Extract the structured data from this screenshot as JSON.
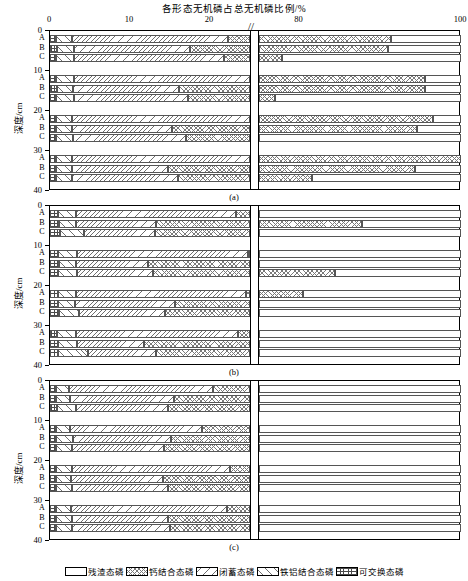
{
  "chart_data": {
    "type": "bar",
    "orientation": "horizontal",
    "stacked": true,
    "title": "各形态无机磷占总无机磷比例/%",
    "xlabel": "",
    "ylabel": "深度/cm",
    "xlim": [
      0,
      100
    ],
    "axis_break": {
      "low_end": 25,
      "high_start": 75,
      "marker": "//"
    },
    "xticks": [
      0,
      10,
      20,
      80,
      100
    ],
    "xticklabels": [
      "0",
      "10",
      "20",
      "80",
      "100"
    ],
    "yticks": [
      0,
      10,
      20,
      30,
      40
    ],
    "yticklabels": [
      "0",
      "10",
      "20",
      "30",
      "40"
    ],
    "grid": false,
    "legend_position": "bottom",
    "series": [
      {
        "name": "残渣态磷",
        "key": "residual",
        "pattern": "blank"
      },
      {
        "name": "钙结合态磷",
        "key": "ca_bound",
        "pattern": "cross-hatch"
      },
      {
        "name": "闭蓄态磷",
        "key": "occluded",
        "pattern": "backslash-hatch"
      },
      {
        "name": "铁铝结合态磷",
        "key": "fe_al_bound",
        "pattern": "forward-slash-hatch"
      },
      {
        "name": "可交换态磷",
        "key": "exchangeable",
        "pattern": "dense-grid"
      }
    ],
    "segment_order": [
      "exchangeable",
      "fe_al_bound",
      "occluded",
      "ca_bound",
      "residual"
    ],
    "depth_groups": [
      "0-10",
      "10-20",
      "20-30",
      "30-40"
    ],
    "treatments": [
      "A",
      "B",
      "C"
    ],
    "panels": [
      {
        "label": "(a)",
        "groups": [
          {
            "depth": "0-10",
            "rows": [
              {
                "t": "A",
                "exchangeable": 0.8,
                "fe_al_bound": 2.0,
                "occluded": 19.5,
                "ca_bound": 69.0,
                "residual": 8.7
              },
              {
                "t": "B",
                "exchangeable": 0.9,
                "fe_al_bound": 2.1,
                "occluded": 14.5,
                "ca_bound": 73.5,
                "residual": 9.0
              },
              {
                "t": "C",
                "exchangeable": 0.8,
                "fe_al_bound": 2.2,
                "occluded": 18.8,
                "ca_bound": 56.0,
                "residual": 22.2
              }
            ]
          },
          {
            "depth": "10-20",
            "rows": [
              {
                "t": "A",
                "exchangeable": 0.8,
                "fe_al_bound": 2.2,
                "occluded": 22.0,
                "ca_bound": 70.5,
                "residual": 4.5
              },
              {
                "t": "B",
                "exchangeable": 0.9,
                "fe_al_bound": 2.0,
                "occluded": 13.2,
                "ca_bound": 79.4,
                "residual": 4.5
              },
              {
                "t": "C",
                "exchangeable": 0.8,
                "fe_al_bound": 2.2,
                "occluded": 14.2,
                "ca_bound": 59.8,
                "residual": 23.0
              }
            ]
          },
          {
            "depth": "20-30",
            "rows": [
              {
                "t": "A",
                "exchangeable": 0.7,
                "fe_al_bound": 2.0,
                "occluded": 22.3,
                "ca_bound": 71.5,
                "residual": 3.5
              },
              {
                "t": "B",
                "exchangeable": 0.8,
                "fe_al_bound": 1.9,
                "occluded": 12.5,
                "ca_bound": 79.3,
                "residual": 5.5
              },
              {
                "t": "C",
                "exchangeable": 0.8,
                "fe_al_bound": 2.1,
                "occluded": 14.1,
                "ca_bound": 54.5,
                "residual": 28.5
              }
            ]
          },
          {
            "depth": "30-40",
            "rows": [
              {
                "t": "A",
                "exchangeable": 0.7,
                "fe_al_bound": 2.1,
                "occluded": 22.2,
                "ca_bound": 78.5,
                "residual": 0.0
              },
              {
                "t": "B",
                "exchangeable": 0.8,
                "fe_al_bound": 2.0,
                "occluded": 12.0,
                "ca_bound": 79.5,
                "residual": 5.7
              },
              {
                "t": "C",
                "exchangeable": 0.8,
                "fe_al_bound": 2.0,
                "occluded": 13.2,
                "ca_bound": 65.5,
                "residual": 18.5
              }
            ]
          }
        ]
      },
      {
        "label": "(b)",
        "groups": [
          {
            "depth": "0-10",
            "rows": [
              {
                "t": "A",
                "exchangeable": 1.0,
                "fe_al_bound": 2.3,
                "occluded": 20.0,
                "ca_bound": 48.5,
                "residual": 28.2
              },
              {
                "t": "B",
                "exchangeable": 1.1,
                "fe_al_bound": 2.2,
                "occluded": 10.0,
                "ca_bound": 74.5,
                "residual": 12.2
              },
              {
                "t": "C",
                "exchangeable": 1.3,
                "fe_al_bound": 3.0,
                "occluded": 8.8,
                "ca_bound": 50.0,
                "residual": 36.9
              }
            ]
          },
          {
            "depth": "10-20",
            "rows": [
              {
                "t": "A",
                "exchangeable": 1.0,
                "fe_al_bound": 2.4,
                "occluded": 21.3,
                "ca_bound": 47.0,
                "residual": 28.3
              },
              {
                "t": "B",
                "exchangeable": 1.1,
                "fe_al_bound": 2.2,
                "occluded": 9.0,
                "ca_bound": 62.5,
                "residual": 25.2
              },
              {
                "t": "C",
                "exchangeable": 1.0,
                "fe_al_bound": 2.4,
                "occluded": 9.5,
                "ca_bound": 71.5,
                "residual": 15.6
              }
            ]
          },
          {
            "depth": "20-30",
            "rows": [
              {
                "t": "A",
                "exchangeable": 1.0,
                "fe_al_bound": 2.3,
                "occluded": 21.2,
                "ca_bound": 56.0,
                "residual": 19.5
              },
              {
                "t": "B",
                "exchangeable": 1.0,
                "fe_al_bound": 2.1,
                "occluded": 12.5,
                "ca_bound": 50.5,
                "residual": 33.9
              },
              {
                "t": "C",
                "exchangeable": 1.1,
                "fe_al_bound": 2.5,
                "occluded": 10.8,
                "ca_bound": 51.0,
                "residual": 34.6
              }
            ]
          },
          {
            "depth": "30-40",
            "rows": [
              {
                "t": "A",
                "exchangeable": 0.9,
                "fe_al_bound": 2.3,
                "occluded": 20.3,
                "ca_bound": 49.0,
                "residual": 27.5
              },
              {
                "t": "B",
                "exchangeable": 1.0,
                "fe_al_bound": 2.4,
                "occluded": 8.3,
                "ca_bound": 50.5,
                "residual": 37.8
              },
              {
                "t": "C",
                "exchangeable": 1.0,
                "fe_al_bound": 3.8,
                "occluded": 8.4,
                "ca_bound": 51.0,
                "residual": 35.8
              }
            ]
          }
        ]
      },
      {
        "label": "(c)",
        "groups": [
          {
            "depth": "0-10",
            "rows": [
              {
                "t": "A",
                "exchangeable": 0.8,
                "fe_al_bound": 1.6,
                "occluded": 18.0,
                "ca_bound": 45.0,
                "residual": 34.6
              },
              {
                "t": "B",
                "exchangeable": 0.8,
                "fe_al_bound": 1.7,
                "occluded": 13.0,
                "ca_bound": 46.5,
                "residual": 38.0
              },
              {
                "t": "C",
                "exchangeable": 0.9,
                "fe_al_bound": 2.4,
                "occluded": 11.5,
                "ca_bound": 43.5,
                "residual": 41.7
              }
            ]
          },
          {
            "depth": "10-20",
            "rows": [
              {
                "t": "A",
                "exchangeable": 0.8,
                "fe_al_bound": 1.7,
                "occluded": 16.5,
                "ca_bound": 47.0,
                "residual": 34.0
              },
              {
                "t": "B",
                "exchangeable": 0.8,
                "fe_al_bound": 2.1,
                "occluded": 12.2,
                "ca_bound": 49.5,
                "residual": 35.4
              },
              {
                "t": "C",
                "exchangeable": 0.8,
                "fe_al_bound": 2.0,
                "occluded": 11.5,
                "ca_bound": 46.5,
                "residual": 39.2
              }
            ]
          },
          {
            "depth": "20-30",
            "rows": [
              {
                "t": "A",
                "exchangeable": 0.8,
                "fe_al_bound": 1.9,
                "occluded": 19.8,
                "ca_bound": 49.0,
                "residual": 28.5
              },
              {
                "t": "B",
                "exchangeable": 0.8,
                "fe_al_bound": 1.8,
                "occluded": 11.5,
                "ca_bound": 52.0,
                "residual": 33.9
              },
              {
                "t": "C",
                "exchangeable": 0.8,
                "fe_al_bound": 2.0,
                "occluded": 12.0,
                "ca_bound": 42.5,
                "residual": 42.7
              }
            ]
          },
          {
            "depth": "30-40",
            "rows": [
              {
                "t": "A",
                "exchangeable": 0.8,
                "fe_al_bound": 1.8,
                "occluded": 19.5,
                "ca_bound": 47.0,
                "residual": 30.9
              },
              {
                "t": "B",
                "exchangeable": 0.8,
                "fe_al_bound": 1.9,
                "occluded": 12.0,
                "ca_bound": 51.5,
                "residual": 33.8
              },
              {
                "t": "C",
                "exchangeable": 0.8,
                "fe_al_bound": 1.9,
                "occluded": 12.3,
                "ca_bound": 42.0,
                "residual": 43.0
              }
            ]
          }
        ]
      }
    ]
  },
  "legend": {
    "items": [
      {
        "label": "残渣态磷",
        "key": "residual"
      },
      {
        "label": "钙结合态磷",
        "key": "ca_bound"
      },
      {
        "label": "闭蓄态磷",
        "key": "occluded"
      },
      {
        "label": "铁铝结合态磷",
        "key": "fe_al_bound"
      },
      {
        "label": "可交换态磷",
        "key": "exchangeable"
      }
    ]
  }
}
